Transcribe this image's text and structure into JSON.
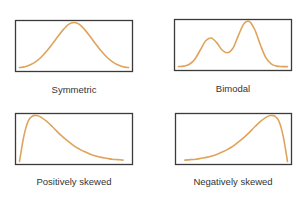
{
  "chart_data": [
    {
      "type": "line",
      "title": "Symmetric",
      "shape": "symmetric",
      "description": "Single bell-shaped peak centered in the middle",
      "x": [
        0,
        0.05,
        0.1,
        0.15,
        0.2,
        0.25,
        0.3,
        0.35,
        0.4,
        0.45,
        0.5,
        0.55,
        0.6,
        0.65,
        0.7,
        0.75,
        0.8,
        0.85,
        0.9,
        0.95,
        1
      ],
      "y": [
        0.02,
        0.04,
        0.08,
        0.15,
        0.25,
        0.38,
        0.53,
        0.69,
        0.84,
        0.96,
        1.0,
        0.96,
        0.84,
        0.69,
        0.53,
        0.38,
        0.25,
        0.15,
        0.08,
        0.04,
        0.02
      ],
      "xlabel": "",
      "ylabel": "",
      "grid": false
    },
    {
      "type": "line",
      "title": "Bimodal",
      "shape": "bimodal",
      "description": "Two peaks: smaller left peak, taller right peak",
      "x": [
        0,
        0.05,
        0.1,
        0.15,
        0.2,
        0.25,
        0.3,
        0.35,
        0.4,
        0.45,
        0.5,
        0.55,
        0.6,
        0.65,
        0.7,
        0.75,
        0.8,
        0.85,
        0.9,
        0.95,
        1
      ],
      "y": [
        0.02,
        0.03,
        0.07,
        0.18,
        0.38,
        0.58,
        0.64,
        0.54,
        0.38,
        0.32,
        0.42,
        0.7,
        0.95,
        1.0,
        0.82,
        0.5,
        0.22,
        0.08,
        0.03,
        0.02,
        0.02
      ],
      "xlabel": "",
      "ylabel": "",
      "grid": false
    },
    {
      "type": "line",
      "title": "Positively skewed",
      "shape": "right-skewed",
      "description": "Peak near left, long tail to the right",
      "x": [
        0,
        0.04,
        0.08,
        0.12,
        0.16,
        0.2,
        0.25,
        0.3,
        0.35,
        0.4,
        0.45,
        0.5,
        0.55,
        0.6,
        0.65,
        0.7,
        0.75,
        0.8,
        0.85,
        0.9,
        0.95
      ],
      "y": [
        0.0,
        0.55,
        0.88,
        0.99,
        1.0,
        0.96,
        0.87,
        0.76,
        0.64,
        0.53,
        0.43,
        0.34,
        0.27,
        0.21,
        0.16,
        0.12,
        0.09,
        0.07,
        0.05,
        0.04,
        0.03
      ],
      "xlabel": "",
      "ylabel": "",
      "grid": false
    },
    {
      "type": "line",
      "title": "Negatively skewed",
      "shape": "left-skewed",
      "description": "Long tail to the left, peak near right",
      "x": [
        0.05,
        0.1,
        0.15,
        0.2,
        0.25,
        0.3,
        0.35,
        0.4,
        0.45,
        0.5,
        0.55,
        0.6,
        0.65,
        0.7,
        0.75,
        0.8,
        0.84,
        0.88,
        0.92,
        0.96,
        1.0
      ],
      "y": [
        0.03,
        0.04,
        0.05,
        0.07,
        0.09,
        0.12,
        0.16,
        0.21,
        0.27,
        0.34,
        0.43,
        0.53,
        0.64,
        0.76,
        0.87,
        0.96,
        1.0,
        0.99,
        0.88,
        0.55,
        0.0
      ],
      "xlabel": "",
      "ylabel": "",
      "grid": false
    }
  ],
  "colors": {
    "curve": "#dfa35c",
    "frame": "#3a3a3a",
    "label": "#333333"
  }
}
